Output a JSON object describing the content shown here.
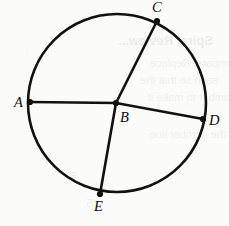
{
  "figure": {
    "kind": "circle-with-chords",
    "width": 229,
    "height": 226,
    "background_color": "#fbfbfa",
    "stroke_color": "#111111",
    "circle": {
      "cx": 117,
      "cy": 103,
      "r": 89,
      "stroke_width": 2.6
    },
    "points": [
      {
        "id": "A",
        "label": "A",
        "x": 30,
        "y": 102,
        "label_x": 14,
        "label_y": 95,
        "on_circle": true,
        "dot": true
      },
      {
        "id": "B",
        "label": "B",
        "x": 116,
        "y": 103,
        "label_x": 120,
        "label_y": 110,
        "on_circle": false,
        "dot": true
      },
      {
        "id": "C",
        "label": "C",
        "x": 157,
        "y": 21,
        "label_x": 152,
        "label_y": 0,
        "on_circle": true,
        "dot": true
      },
      {
        "id": "D",
        "label": "D",
        "x": 203,
        "y": 119,
        "label_x": 209,
        "label_y": 113,
        "on_circle": true,
        "dot": true
      },
      {
        "id": "E",
        "label": "E",
        "x": 100,
        "y": 194,
        "label_x": 94,
        "label_y": 199,
        "on_circle": true,
        "dot": true
      }
    ],
    "segments": [
      {
        "id": "AB",
        "from": "A",
        "to": "B",
        "x1": 30,
        "y1": 102,
        "x2": 116,
        "y2": 103,
        "stroke_width": 2.6
      },
      {
        "id": "BD",
        "from": "B",
        "to": "D",
        "x1": 116,
        "y1": 103,
        "x2": 203,
        "y2": 119,
        "stroke_width": 2.6
      },
      {
        "id": "CB",
        "from": "C",
        "to": "B",
        "x1": 157,
        "y1": 21,
        "x2": 116,
        "y2": 103,
        "stroke_width": 2.6
      },
      {
        "id": "BE",
        "from": "B",
        "to": "E",
        "x1": 116,
        "y1": 103,
        "x2": 100,
        "y2": 194,
        "stroke_width": 2.6
      }
    ],
    "dot_radius": 3.1
  },
  "bleed_through": [
    {
      "text": "Spiral Review...",
      "x": 118,
      "y": 33,
      "size": 13
    },
    {
      "text": "to compare. Replace",
      "x": 150,
      "y": 57,
      "size": 11
    },
    {
      "text": "each so that the",
      "x": 140,
      "y": 74,
      "size": 11
    },
    {
      "text": "number to make it",
      "x": 148,
      "y": 91,
      "size": 11
    },
    {
      "text": "on the number line",
      "x": 150,
      "y": 128,
      "size": 11
    },
    {
      "text": "8",
      "x": 70,
      "y": 170,
      "size": 11
    },
    {
      "text": "5",
      "x": 86,
      "y": 197,
      "size": 11
    }
  ]
}
